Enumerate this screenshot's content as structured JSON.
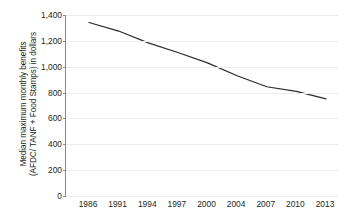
{
  "chart_data": {
    "type": "line",
    "title": "",
    "xlabel": "",
    "ylabel": "Median maximum monthly benefits (AFDC/ TANF + Food Stamps) in dollars",
    "ylabel_lines": [
      "Median maximum monthly benefits",
      "(AFDC/ TANF + Food Stamps) in dollars"
    ],
    "categories": [
      "1986",
      "1991",
      "1994",
      "1997",
      "2000",
      "2004",
      "2007",
      "2010",
      "2013"
    ],
    "values": [
      1342,
      1276,
      1185,
      1110,
      1030,
      930,
      845,
      810,
      752
    ],
    "series": [
      {
        "name": "Median maximum monthly benefits",
        "values": [
          1342,
          1276,
          1185,
          1110,
          1030,
          930,
          845,
          810,
          752
        ]
      }
    ],
    "ylim": [
      0,
      1400
    ],
    "y_ticks": [
      0,
      200,
      400,
      600,
      800,
      1000,
      1200,
      1400
    ],
    "y_tick_labels": [
      "0",
      "200",
      "400",
      "600",
      "800",
      "1,000",
      "1,200",
      "1,400"
    ],
    "grid": true,
    "legend": false,
    "legend_position": "none",
    "line_color": "#2b2b2b",
    "grid_color": "#ededee",
    "axis_color": "#8a8a8a",
    "background_color": "#ffffff",
    "text_color": "#231f20"
  }
}
